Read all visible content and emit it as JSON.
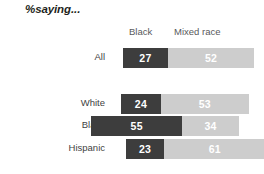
{
  "title": "%saying...",
  "headers": {
    "series_1": "Black",
    "series_2": "Mixed race"
  },
  "rows": [
    {
      "label": "All",
      "black": 27,
      "mixed": 52
    },
    {
      "label": "White",
      "black": 24,
      "mixed": 53
    },
    {
      "label": "Black",
      "black": 55,
      "mixed": 34
    },
    {
      "label": "Hispanic",
      "black": 23,
      "mixed": 61
    }
  ],
  "colors": {
    "series_1": "#3d3d3d",
    "series_2": "#cdcdcd",
    "value_text": "#ffffff",
    "label_text": "#3f3f3f",
    "header_text": "#58595b",
    "title_text": "#231f20",
    "background": "#ffffff"
  },
  "chart_data": {
    "type": "bar",
    "title": "%saying...",
    "subtype": "stacked-horizontal",
    "categories": [
      "All",
      "White",
      "Black",
      "Hispanic"
    ],
    "series": [
      {
        "name": "Black",
        "values": [
          27,
          24,
          55,
          23
        ],
        "color": "#3d3d3d"
      },
      {
        "name": "Mixed race",
        "values": [
          52,
          53,
          34,
          61
        ],
        "color": "#cdcdcd"
      }
    ],
    "xlabel": "",
    "ylabel": "",
    "xlim": [
      0,
      100
    ],
    "grid": false,
    "legend": "top",
    "data_labels": true,
    "units": "percent"
  },
  "layout": {
    "px_per_unit": 1.66,
    "bar_height": 20,
    "row_tops": [
      48,
      94,
      116,
      139
    ],
    "bar_starts": [
      123,
      121,
      91,
      126
    ]
  }
}
